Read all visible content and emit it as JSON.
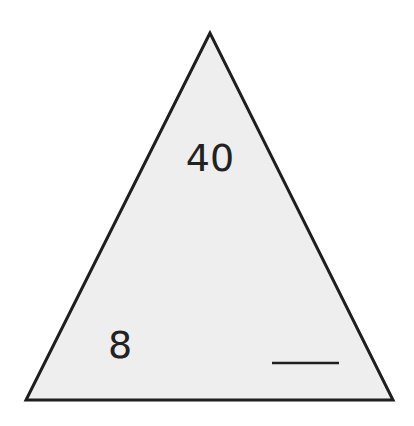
{
  "diagram": {
    "type": "fact-family-triangle",
    "top_value": "40",
    "bottom_left_value": "8",
    "bottom_right_value": "",
    "bottom_right_blank": true,
    "colors": {
      "fill": "#eeeeee",
      "stroke": "#1e1e1e",
      "text": "#222222"
    }
  }
}
